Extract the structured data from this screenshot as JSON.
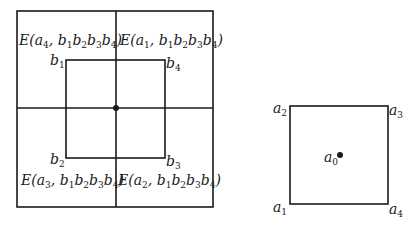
{
  "left_diagram": {
    "quadrant_labels": {
      "top_left": {
        "fn": "E",
        "a": "4",
        "b": [
          "1",
          "2",
          "3",
          "4"
        ]
      },
      "top_right": {
        "fn": "E",
        "a": "1",
        "b": [
          "1",
          "2",
          "3",
          "4"
        ]
      },
      "bottom_left": {
        "fn": "E",
        "a": "3",
        "b": [
          "1",
          "2",
          "3",
          "4"
        ]
      },
      "bottom_right": {
        "fn": "E",
        "a": "2",
        "b": [
          "1",
          "2",
          "3",
          "4"
        ]
      }
    },
    "inner_corners": {
      "top_left": {
        "var": "b",
        "sub": "1"
      },
      "top_right": {
        "var": "b",
        "sub": "4"
      },
      "bottom_left": {
        "var": "b",
        "sub": "2"
      },
      "bottom_right": {
        "var": "b",
        "sub": "3"
      }
    }
  },
  "right_diagram": {
    "corners": {
      "top_left": {
        "var": "a",
        "sub": "2"
      },
      "top_right": {
        "var": "a",
        "sub": "3"
      },
      "bottom_left": {
        "var": "a",
        "sub": "1"
      },
      "bottom_right": {
        "var": "a",
        "sub": "4"
      }
    },
    "center": {
      "var": "a",
      "sub": "0"
    }
  },
  "colors": {
    "stroke": "#1a1a1a",
    "background": "#ffffff"
  }
}
